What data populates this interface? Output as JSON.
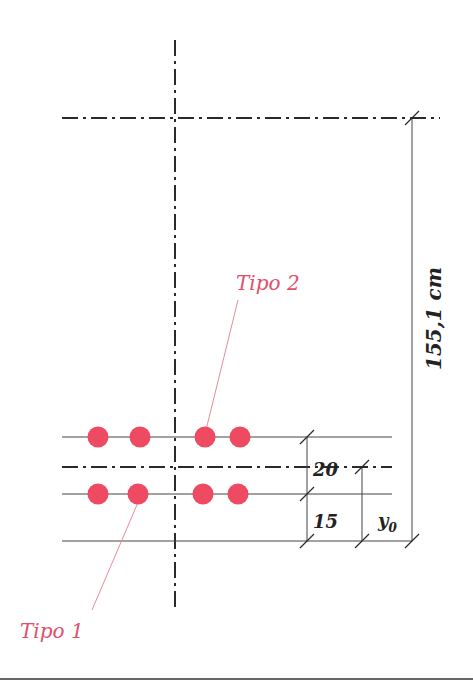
{
  "colors": {
    "ink": "#2a2a2a",
    "bar": "#ee4a62",
    "label_accent": "#e0506a",
    "background": "#ffffff"
  },
  "labels": {
    "tipo2": "Tipo 2",
    "tipo1": "Tipo 1",
    "dim_total": "155,1 cm",
    "dim_20": "20",
    "dim_15": "15",
    "dim_y": "y",
    "dim_y_sub": "0"
  },
  "bars": {
    "top_row": [
      98,
      140,
      205,
      240
    ],
    "bottom_row": [
      98,
      138,
      203,
      238
    ]
  }
}
